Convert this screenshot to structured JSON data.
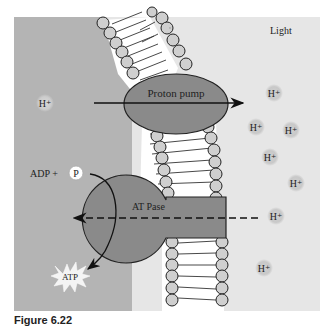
{
  "diagram": {
    "labels": {
      "light": "Light",
      "proton_pump": "Proton pump",
      "atpase": "AT Pase",
      "adp": "ADP +",
      "phosphate": "P",
      "atp": "ATP",
      "proton": "H⁺"
    },
    "protons_left": [
      {
        "x": 45,
        "y": 103
      }
    ],
    "protons_right": [
      {
        "x": 274,
        "y": 93
      },
      {
        "x": 256,
        "y": 127
      },
      {
        "x": 291,
        "y": 130
      },
      {
        "x": 270,
        "y": 157
      },
      {
        "x": 296,
        "y": 183
      },
      {
        "x": 276,
        "y": 216
      },
      {
        "x": 264,
        "y": 268
      }
    ],
    "colors": {
      "stroma": "#b4b4b4",
      "lumen": "#e6e6e6",
      "protein": "#8a8a8a",
      "lipid_head": "#cfcfcf",
      "outline": "#222222"
    }
  },
  "caption": "Figure 6.22"
}
